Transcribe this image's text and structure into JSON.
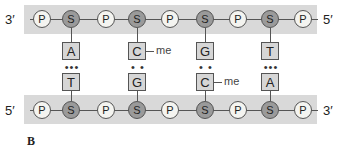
{
  "figure_label": "B",
  "top_strand": {
    "left_end": "3′",
    "right_end": "5′",
    "backbone": [
      "P",
      "S",
      "P",
      "S",
      "P",
      "S",
      "P",
      "S",
      "P"
    ],
    "bases": [
      "A",
      "C",
      "G",
      "T"
    ],
    "methylated": [
      false,
      true,
      false,
      false
    ]
  },
  "bottom_strand": {
    "left_end": "5′",
    "right_end": "3′",
    "backbone": [
      "P",
      "S",
      "P",
      "S",
      "P",
      "S",
      "P",
      "S",
      "P"
    ],
    "bases": [
      "T",
      "G",
      "C",
      "A"
    ],
    "methylated": [
      false,
      false,
      true,
      false
    ]
  },
  "hydrogen_bonds": [
    "•••",
    "• •",
    "• •",
    "•••"
  ],
  "methyl_label": "me",
  "colors": {
    "band": "#d9d9d9",
    "sugar": "#9a9a9a",
    "phosphate": "#f4f4f0",
    "base": "#d6d6d6"
  }
}
